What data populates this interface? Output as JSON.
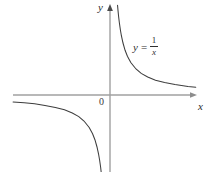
{
  "figure": {
    "title": "",
    "axis_labels": {
      "x": "x",
      "y": "y",
      "origin": "0"
    },
    "equation": {
      "lhs": "y",
      "operator": "=",
      "numerator": "1",
      "denominator": "x",
      "plain": "y = 1/x"
    },
    "colors": {
      "axis": "#9a9a9a",
      "curve": "#3b3b3b",
      "background": "#ffffff",
      "text": "#2b2b2b"
    }
  },
  "chart_data": {
    "type": "line",
    "title": "",
    "subtitle": "",
    "xlabel": "x",
    "ylabel": "y",
    "grid": false,
    "legend": false,
    "annotations": [
      {
        "text": "y = 1/x",
        "x": 2.1,
        "y": 2.3
      },
      {
        "text": "0",
        "x": -0.25,
        "y": -0.25
      }
    ],
    "axis_origin_px": {
      "x": 110,
      "y": 95
    },
    "axis_extent_px": {
      "x_left": 13,
      "x_right": 196,
      "y_top": 5,
      "y_bottom": 172
    },
    "px_per_unit": {
      "x": 26,
      "y": 26
    },
    "xlim": [
      -3.73,
      3.3
    ],
    "ylim": [
      -2.96,
      3.46
    ],
    "series": [
      {
        "name": "y = 1/x (branch x > 0)",
        "function": "1/x",
        "x": [
          0.29,
          0.31,
          0.33,
          0.36,
          0.4,
          0.44,
          0.5,
          0.58,
          0.67,
          0.8,
          1.0,
          1.2,
          1.45,
          1.75,
          2.1,
          2.5,
          3.0,
          3.3
        ],
        "y": [
          3.45,
          3.23,
          3.03,
          2.78,
          2.5,
          2.27,
          2.0,
          1.72,
          1.49,
          1.25,
          1.0,
          0.83,
          0.69,
          0.57,
          0.48,
          0.4,
          0.33,
          0.3
        ]
      },
      {
        "name": "y = 1/x (branch x < 0)",
        "function": "1/x",
        "x": [
          -3.73,
          -3.3,
          -2.9,
          -2.5,
          -2.1,
          -1.75,
          -1.45,
          -1.2,
          -1.0,
          -0.8,
          -0.67,
          -0.58,
          -0.5,
          -0.44,
          -0.4,
          -0.36,
          -0.34
        ],
        "y": [
          -0.27,
          -0.3,
          -0.34,
          -0.4,
          -0.48,
          -0.57,
          -0.69,
          -0.83,
          -1.0,
          -1.25,
          -1.49,
          -1.72,
          -2.0,
          -2.27,
          -2.5,
          -2.78,
          -2.96
        ]
      }
    ],
    "asymptotes": [
      {
        "type": "vertical",
        "value": 0
      },
      {
        "type": "horizontal",
        "value": 0
      }
    ]
  }
}
